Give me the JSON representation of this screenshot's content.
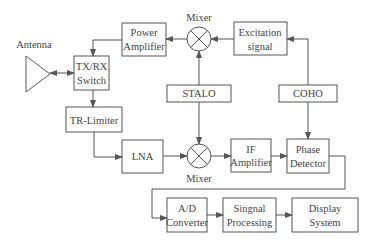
{
  "diagram": {
    "colors": {
      "line": "#555555",
      "text": "#444444",
      "background": "#ffffff"
    },
    "antenna": {
      "label": "Antenna"
    },
    "blocks": {
      "power_amplifier": {
        "line1": "Power",
        "line2": "Amplifier"
      },
      "excitation_signal": {
        "line1": "Excitation",
        "line2": "signal"
      },
      "txrx_switch": {
        "line1": "TX/RX",
        "line2": "Switch"
      },
      "stalo": {
        "label": "STALO"
      },
      "coho": {
        "label": "COHO"
      },
      "tr_limiter": {
        "label": "TR-Limiter"
      },
      "lna": {
        "label": "LNA"
      },
      "if_amplifier": {
        "line1": "IF",
        "line2": "Amplifier"
      },
      "phase_detector": {
        "line1": "Phase",
        "line2": "Detector"
      },
      "ad_converter": {
        "line1": "A/D",
        "line2": "Converter"
      },
      "signal_processing": {
        "line1": "Singnal",
        "line2": "Processing"
      },
      "display_system": {
        "line1": "Display",
        "line2": "System"
      }
    },
    "mixers": {
      "top": {
        "label": "Mixer"
      },
      "bottom": {
        "label": "Mixer"
      }
    }
  }
}
